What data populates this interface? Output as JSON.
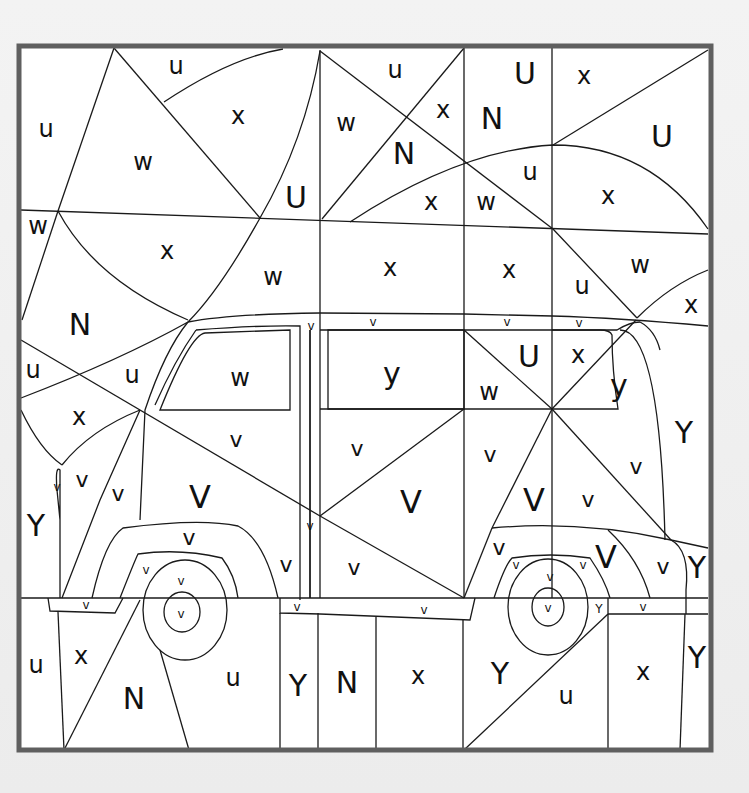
{
  "page": {
    "frame_color": "#5f5f5f",
    "line_color": "#1a1a1a",
    "paper_color": "#ffffff",
    "background_color": "#efefef"
  },
  "labels": [
    {
      "t": "u",
      "x": 176,
      "y": 66,
      "s": 24
    },
    {
      "t": "u",
      "x": 46,
      "y": 129,
      "s": 24
    },
    {
      "t": "w",
      "x": 143,
      "y": 162,
      "s": 24
    },
    {
      "t": "x",
      "x": 238,
      "y": 116,
      "s": 24
    },
    {
      "t": "U",
      "x": 296,
      "y": 197,
      "s": 30
    },
    {
      "t": "w",
      "x": 346,
      "y": 123,
      "s": 24
    },
    {
      "t": "u",
      "x": 395,
      "y": 70,
      "s": 24
    },
    {
      "t": "x",
      "x": 443,
      "y": 110,
      "s": 24
    },
    {
      "t": "N",
      "x": 404,
      "y": 153,
      "s": 30
    },
    {
      "t": "N",
      "x": 492,
      "y": 118,
      "s": 30
    },
    {
      "t": "U",
      "x": 525,
      "y": 73,
      "s": 30
    },
    {
      "t": "x",
      "x": 584,
      "y": 76,
      "s": 24
    },
    {
      "t": "U",
      "x": 662,
      "y": 136,
      "s": 30
    },
    {
      "t": "x",
      "x": 431,
      "y": 202,
      "s": 24
    },
    {
      "t": "w",
      "x": 486,
      "y": 202,
      "s": 24
    },
    {
      "t": "u",
      "x": 530,
      "y": 172,
      "s": 24
    },
    {
      "t": "x",
      "x": 608,
      "y": 196,
      "s": 24
    },
    {
      "t": "w",
      "x": 38,
      "y": 226,
      "s": 24
    },
    {
      "t": "x",
      "x": 167,
      "y": 251,
      "s": 24
    },
    {
      "t": "w",
      "x": 273,
      "y": 277,
      "s": 24
    },
    {
      "t": "x",
      "x": 390,
      "y": 268,
      "s": 24
    },
    {
      "t": "x",
      "x": 509,
      "y": 270,
      "s": 24
    },
    {
      "t": "u",
      "x": 582,
      "y": 286,
      "s": 24
    },
    {
      "t": "w",
      "x": 640,
      "y": 265,
      "s": 24
    },
    {
      "t": "x",
      "x": 691,
      "y": 305,
      "s": 24
    },
    {
      "t": "N",
      "x": 80,
      "y": 324,
      "s": 30
    },
    {
      "t": "u",
      "x": 33,
      "y": 370,
      "s": 24
    },
    {
      "t": "u",
      "x": 132,
      "y": 375,
      "s": 24
    },
    {
      "t": "x",
      "x": 79,
      "y": 417,
      "s": 24
    },
    {
      "t": "w",
      "x": 240,
      "y": 378,
      "s": 24
    },
    {
      "t": "y",
      "x": 392,
      "y": 373,
      "s": 30
    },
    {
      "t": "U",
      "x": 529,
      "y": 356,
      "s": 30
    },
    {
      "t": "x",
      "x": 578,
      "y": 355,
      "s": 24
    },
    {
      "t": "w",
      "x": 489,
      "y": 392,
      "s": 24
    },
    {
      "t": "y",
      "x": 619,
      "y": 385,
      "s": 30
    },
    {
      "t": "Y",
      "x": 684,
      "y": 432,
      "s": 30
    },
    {
      "t": "v",
      "x": 236,
      "y": 439,
      "s": 22
    },
    {
      "t": "v",
      "x": 357,
      "y": 448,
      "s": 22
    },
    {
      "t": "v",
      "x": 490,
      "y": 454,
      "s": 22
    },
    {
      "t": "v",
      "x": 636,
      "y": 466,
      "s": 22
    },
    {
      "t": "v",
      "x": 82,
      "y": 479,
      "s": 22
    },
    {
      "t": "v",
      "x": 118,
      "y": 493,
      "s": 22
    },
    {
      "t": "V",
      "x": 200,
      "y": 497,
      "s": 32
    },
    {
      "t": "V",
      "x": 411,
      "y": 502,
      "s": 32
    },
    {
      "t": "V",
      "x": 534,
      "y": 500,
      "s": 32
    },
    {
      "t": "v",
      "x": 588,
      "y": 499,
      "s": 22
    },
    {
      "t": "Y",
      "x": 36,
      "y": 525,
      "s": 30
    },
    {
      "t": "v",
      "x": 189,
      "y": 537,
      "s": 22
    },
    {
      "t": "v",
      "x": 286,
      "y": 564,
      "s": 22
    },
    {
      "t": "v",
      "x": 354,
      "y": 567,
      "s": 22
    },
    {
      "t": "v",
      "x": 499,
      "y": 547,
      "s": 22
    },
    {
      "t": "V",
      "x": 606,
      "y": 557,
      "s": 32
    },
    {
      "t": "v",
      "x": 663,
      "y": 566,
      "s": 22
    },
    {
      "t": "Y",
      "x": 697,
      "y": 567,
      "s": 30
    },
    {
      "t": "v",
      "x": 310,
      "y": 526,
      "s": 12
    },
    {
      "t": "v",
      "x": 146,
      "y": 570,
      "s": 12
    },
    {
      "t": "v",
      "x": 181,
      "y": 581,
      "s": 12
    },
    {
      "t": "v",
      "x": 181,
      "y": 614,
      "s": 12
    },
    {
      "t": "v",
      "x": 86,
      "y": 605,
      "s": 12
    },
    {
      "t": "v",
      "x": 297,
      "y": 607,
      "s": 12
    },
    {
      "t": "v",
      "x": 424,
      "y": 610,
      "s": 12
    },
    {
      "t": "v",
      "x": 516,
      "y": 565,
      "s": 12
    },
    {
      "t": "v",
      "x": 583,
      "y": 565,
      "s": 12
    },
    {
      "t": "v",
      "x": 550,
      "y": 577,
      "s": 12
    },
    {
      "t": "v",
      "x": 548,
      "y": 608,
      "s": 12
    },
    {
      "t": "Y",
      "x": 599,
      "y": 609,
      "s": 12
    },
    {
      "t": "v",
      "x": 643,
      "y": 607,
      "s": 12
    },
    {
      "t": "v",
      "x": 311,
      "y": 326,
      "s": 12
    },
    {
      "t": "v",
      "x": 373,
      "y": 322,
      "s": 12
    },
    {
      "t": "v",
      "x": 507,
      "y": 322,
      "s": 12
    },
    {
      "t": "v",
      "x": 579,
      "y": 323,
      "s": 12
    },
    {
      "t": "v",
      "x": 57,
      "y": 487,
      "s": 12
    },
    {
      "t": "u",
      "x": 36,
      "y": 665,
      "s": 24
    },
    {
      "t": "x",
      "x": 81,
      "y": 656,
      "s": 24
    },
    {
      "t": "N",
      "x": 134,
      "y": 698,
      "s": 30
    },
    {
      "t": "u",
      "x": 233,
      "y": 678,
      "s": 24
    },
    {
      "t": "Y",
      "x": 298,
      "y": 685,
      "s": 30
    },
    {
      "t": "N",
      "x": 347,
      "y": 682,
      "s": 30
    },
    {
      "t": "x",
      "x": 418,
      "y": 676,
      "s": 24
    },
    {
      "t": "Y",
      "x": 500,
      "y": 673,
      "s": 30
    },
    {
      "t": "u",
      "x": 566,
      "y": 696,
      "s": 24
    },
    {
      "t": "x",
      "x": 643,
      "y": 672,
      "s": 24
    },
    {
      "t": "Y",
      "x": 697,
      "y": 657,
      "s": 30
    }
  ]
}
